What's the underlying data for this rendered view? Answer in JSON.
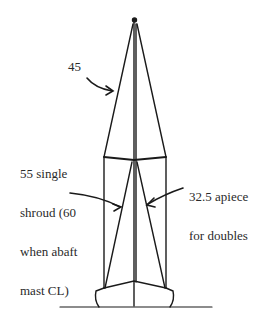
{
  "diagram": {
    "type": "sailboat rig elevation (mast, spreaders, shrouds)",
    "labels": {
      "upper_shroud": "45",
      "lower_single": [
        "55 single",
        "shroud (60",
        "when abaft",
        "mast CL)"
      ],
      "lower_double": [
        "32.5 apiece",
        "for doubles"
      ]
    },
    "colors": {
      "line": "#1a1a1a",
      "background": "#ffffff",
      "text": "#2a2a2a"
    }
  }
}
